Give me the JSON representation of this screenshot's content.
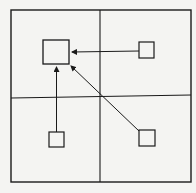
{
  "diagram": {
    "stroke_color": "#1a1a1a",
    "background": "#f4f4f2",
    "frame": {
      "x": 11,
      "y": 10,
      "w": 180,
      "h": 172
    },
    "dividers": {
      "vertical_x": 100,
      "horizontal_y": 97
    },
    "nodes": [
      {
        "id": "target",
        "quadrant": "top-left",
        "x": 43,
        "y": 40,
        "w": 26,
        "h": 24
      },
      {
        "id": "top-right",
        "quadrant": "top-right",
        "x": 139,
        "y": 42,
        "w": 15,
        "h": 16
      },
      {
        "id": "bottom-left",
        "quadrant": "bottom-left",
        "x": 49,
        "y": 132,
        "w": 15,
        "h": 15
      },
      {
        "id": "bottom-right",
        "quadrant": "bottom-right",
        "x": 139,
        "y": 130,
        "w": 16,
        "h": 16
      }
    ],
    "edges": [
      {
        "from": "top-right",
        "to": "target",
        "direction": "horizontal"
      },
      {
        "from": "bottom-left",
        "to": "target",
        "direction": "vertical"
      },
      {
        "from": "bottom-right",
        "to": "target",
        "direction": "diagonal"
      }
    ]
  }
}
